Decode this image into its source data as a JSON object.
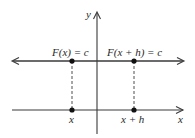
{
  "diagram": {
    "axes": {
      "x_label": "x",
      "y_label": "y"
    },
    "horizontal_line": {
      "left_label": "F(x) = c",
      "right_label": "F(x + h) = c"
    },
    "points": [
      {
        "label": "x"
      },
      {
        "label": "x + h"
      }
    ]
  }
}
